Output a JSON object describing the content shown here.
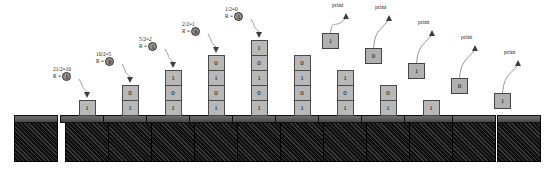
{
  "diagram": {
    "print_label": "print",
    "remainder_prefix": "R =",
    "colors": {
      "block_fill": "#b8b8b8",
      "base_dark": "#161616",
      "cap_gray": "#5a5a5a",
      "circle_fill": "#8f8f8f",
      "arrow": "#3d3d3d"
    }
  },
  "states": [
    {
      "name": "empty-stack",
      "x": 14,
      "blocks": [],
      "label": null,
      "popped": null,
      "print": false
    },
    {
      "name": "push-1",
      "x": 65,
      "blocks": [
        "1"
      ],
      "label": {
        "expr": "21/2=10",
        "remainder": "1"
      },
      "popped": null,
      "print": false
    },
    {
      "name": "push-2",
      "x": 108,
      "blocks": [
        "0",
        "1"
      ],
      "label": {
        "expr": "10/2=5",
        "remainder": "0"
      },
      "popped": null,
      "print": false
    },
    {
      "name": "push-3",
      "x": 151,
      "blocks": [
        "1",
        "0",
        "1"
      ],
      "label": {
        "expr": "5/2=2",
        "remainder": "1"
      },
      "popped": null,
      "print": false
    },
    {
      "name": "push-4",
      "x": 194,
      "blocks": [
        "0",
        "1",
        "0",
        "1"
      ],
      "label": {
        "expr": "2/2=1",
        "remainder": "0"
      },
      "popped": null,
      "print": false
    },
    {
      "name": "push-5",
      "x": 237,
      "blocks": [
        "1",
        "0",
        "1",
        "0",
        "1"
      ],
      "label": {
        "expr": "1/2=0",
        "remainder": "1"
      },
      "popped": null,
      "print": false
    },
    {
      "name": "pop-1",
      "x": 280,
      "blocks": [
        "0",
        "1",
        "0",
        "1"
      ],
      "label": null,
      "popped": "1",
      "print": true
    },
    {
      "name": "pop-2",
      "x": 323,
      "blocks": [
        "1",
        "0",
        "1"
      ],
      "label": null,
      "popped": "0",
      "print": true
    },
    {
      "name": "pop-3",
      "x": 366,
      "blocks": [
        "0",
        "1"
      ],
      "label": null,
      "popped": "1",
      "print": true
    },
    {
      "name": "pop-4",
      "x": 409,
      "blocks": [
        "1"
      ],
      "label": null,
      "popped": "0",
      "print": true
    },
    {
      "name": "pop-5",
      "x": 452,
      "blocks": [],
      "label": null,
      "popped": "1",
      "print": true
    },
    {
      "name": "empty-after-pop",
      "x": 497,
      "blocks": [],
      "label": null,
      "popped": null,
      "print": false
    }
  ]
}
